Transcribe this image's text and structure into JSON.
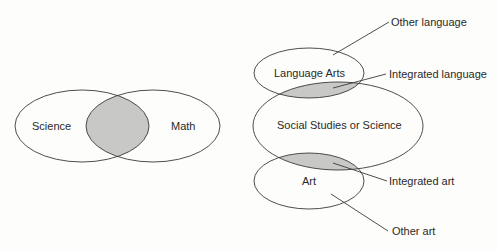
{
  "colors": {
    "background": "#fdfdfb",
    "outline": "#3a3a3a",
    "shaded_overlap": "#c8c8c6",
    "text": "#2a2a2a"
  },
  "left_diagram": {
    "type": "two-circle venn",
    "sets": [
      {
        "label": "Science"
      },
      {
        "label": "Math"
      }
    ],
    "overlap": "shaded"
  },
  "right_diagram": {
    "type": "stacked overlapping ellipses",
    "sets": [
      {
        "label": "Language Arts"
      },
      {
        "label": "Social Studies or Science"
      },
      {
        "label": "Art"
      }
    ],
    "callouts": [
      {
        "label": "Other language"
      },
      {
        "label": "Integrated language"
      },
      {
        "label": "Integrated art"
      },
      {
        "label": "Other art"
      }
    ]
  }
}
